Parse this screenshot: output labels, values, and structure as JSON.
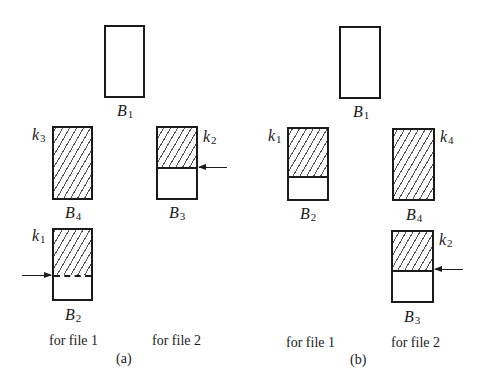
{
  "panels": [
    {
      "id": "a",
      "caption": "(a)",
      "column_labels": [
        "for file 1",
        "for file 2"
      ],
      "buffers": [
        {
          "name": "B",
          "sub": "1",
          "key": null,
          "filled": "empty",
          "pointer": null
        },
        {
          "name": "B",
          "sub": "4",
          "key": {
            "name": "k",
            "sub": "3",
            "side": "left"
          },
          "filled": "full",
          "pointer": null
        },
        {
          "name": "B",
          "sub": "3",
          "key": {
            "name": "k",
            "sub": "2",
            "side": "right"
          },
          "filled": "partial",
          "pointer": "right"
        },
        {
          "name": "B",
          "sub": "2",
          "key": {
            "name": "k",
            "sub": "1",
            "side": "left"
          },
          "filled": "partial",
          "pointer": "left"
        }
      ]
    },
    {
      "id": "b",
      "caption": "(b)",
      "column_labels": [
        "for file 1",
        "for file 2"
      ],
      "buffers": [
        {
          "name": "B",
          "sub": "1",
          "key": null,
          "filled": "empty",
          "pointer": null
        },
        {
          "name": "B",
          "sub": "2",
          "key": {
            "name": "k",
            "sub": "1",
            "side": "left"
          },
          "filled": "partial",
          "pointer": null
        },
        {
          "name": "B",
          "sub": "4",
          "key": {
            "name": "k",
            "sub": "4",
            "side": "right"
          },
          "filled": "full",
          "pointer": null
        },
        {
          "name": "B",
          "sub": "3",
          "key": {
            "name": "k",
            "sub": "2",
            "side": "right"
          },
          "filled": "partial",
          "pointer": "right"
        }
      ]
    }
  ],
  "colors": {
    "line": "#1a1a1a",
    "hatch": "#555555",
    "background": "#ffffff"
  }
}
